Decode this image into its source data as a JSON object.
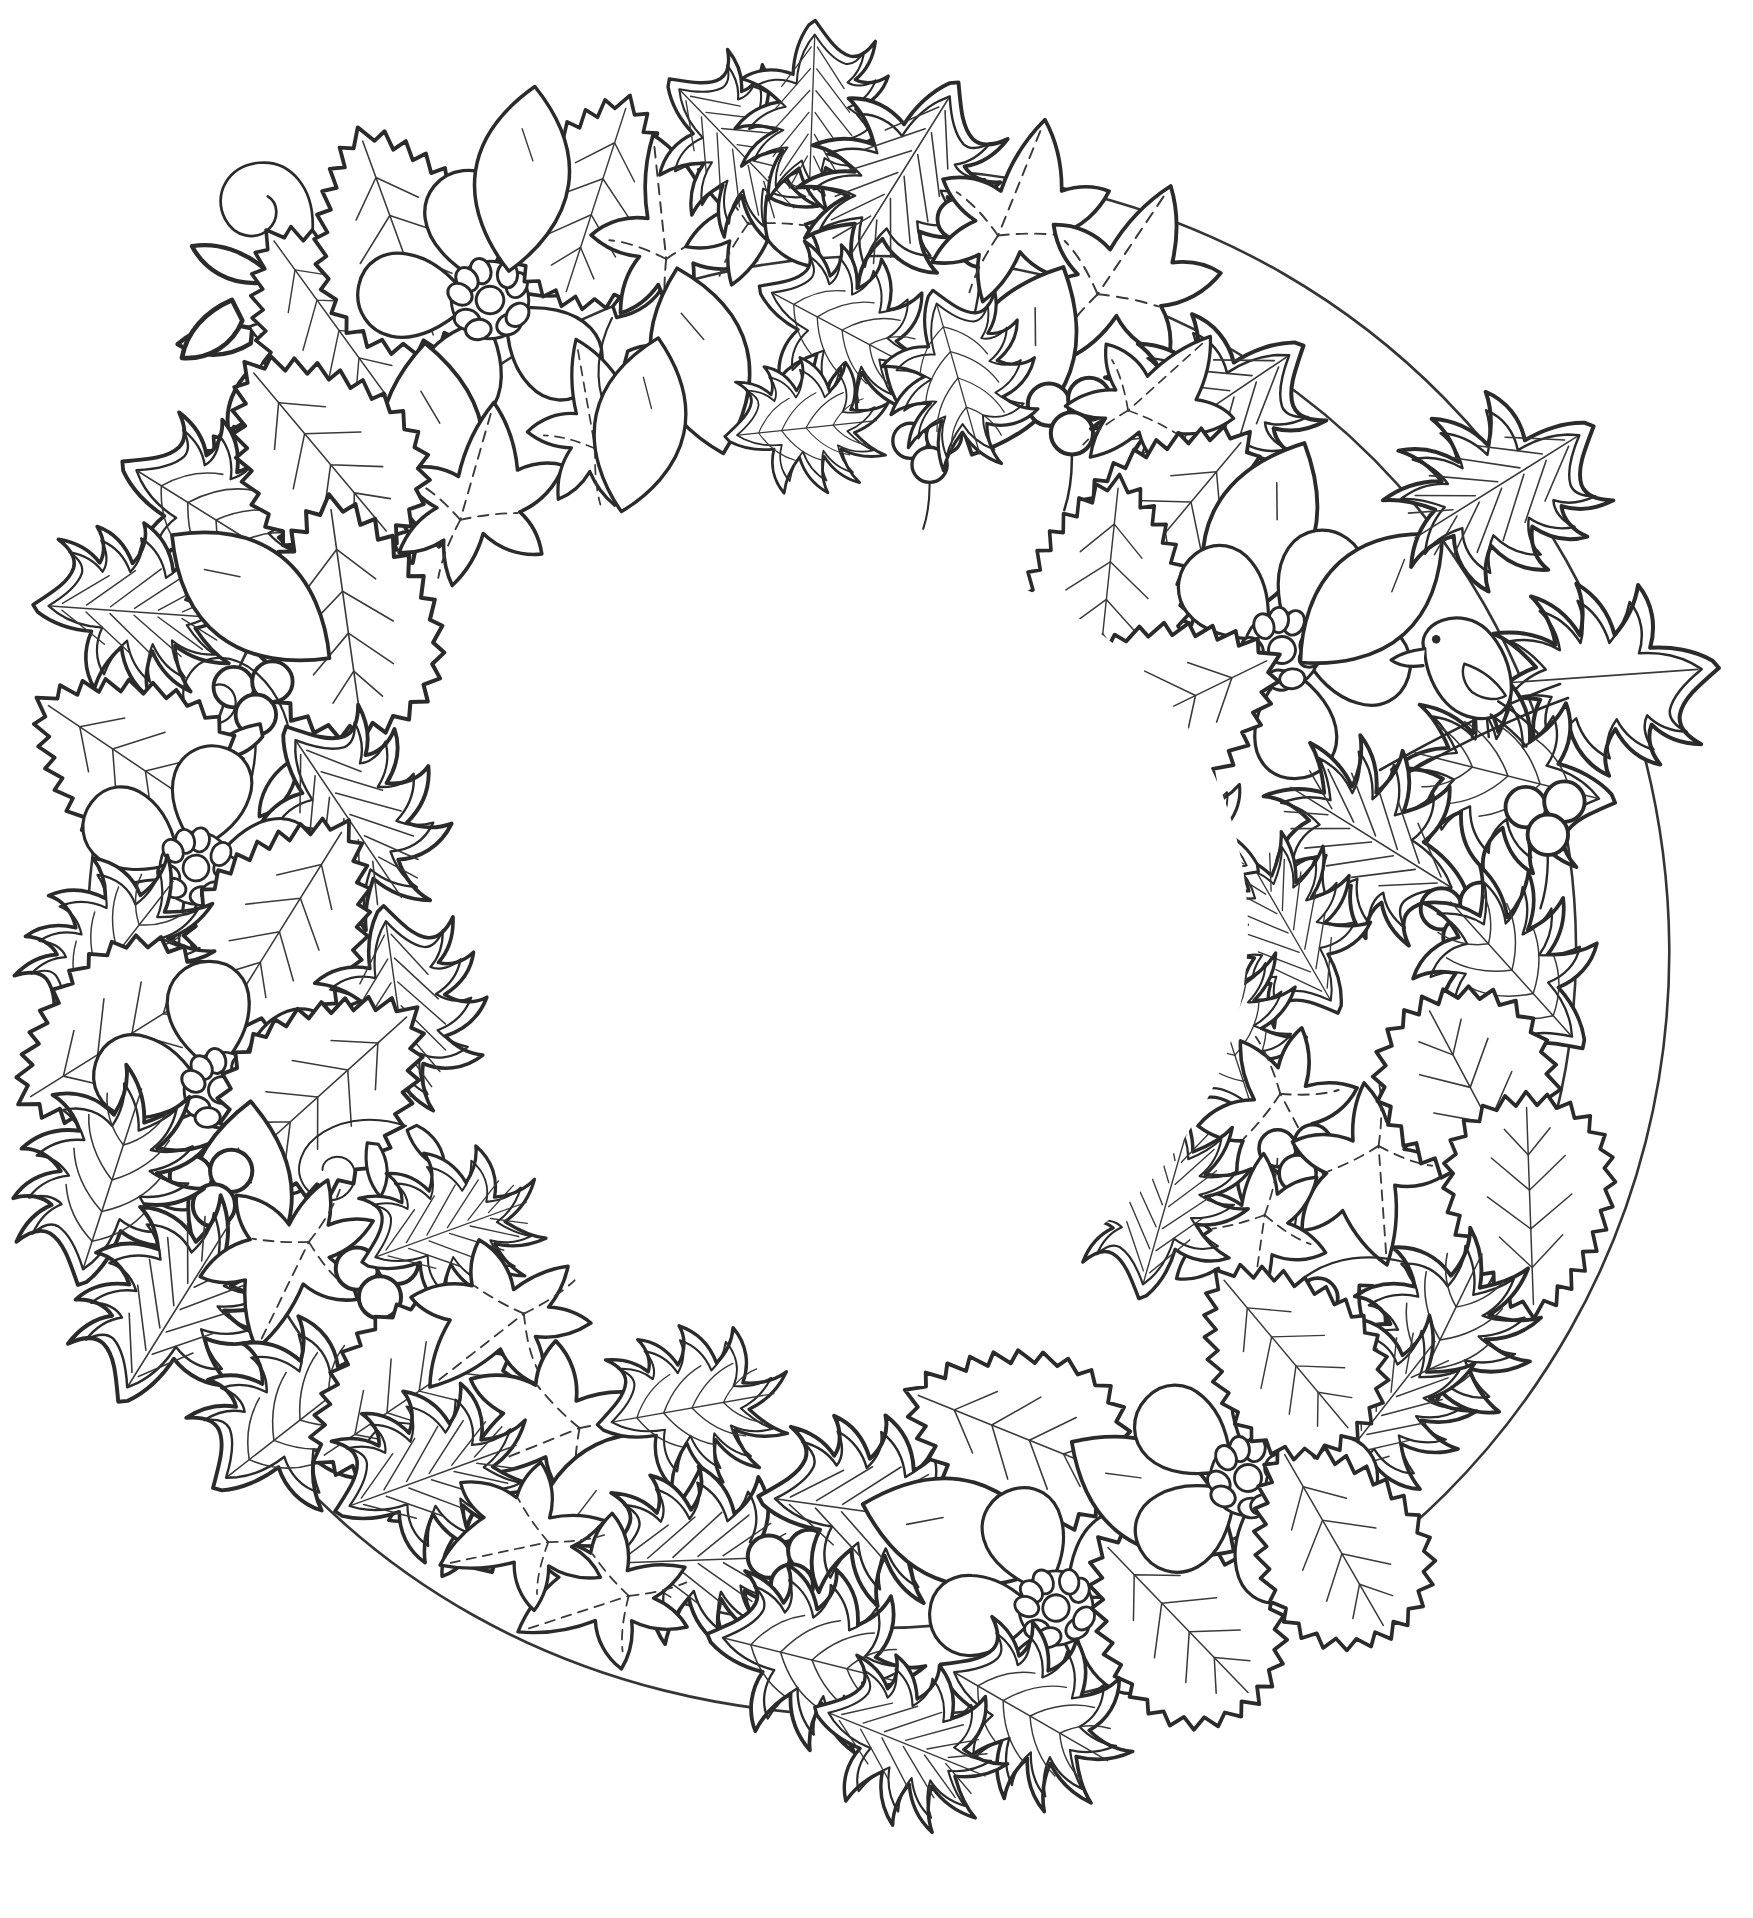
{
  "page": {
    "title": "Christmas Wreath Coloring Page",
    "kind": "line-art-coloring-illustration",
    "background_color": "#ffffff",
    "line_color": "#2b2b2b",
    "secondary_line_color": "#3a3a3a",
    "width": 1753,
    "height": 1918,
    "fill_color": "#ffffff"
  },
  "wreath": {
    "center_x": 876,
    "center_y": 930,
    "outer_radius": 840,
    "inner_radius": 400,
    "empty_center": true,
    "center_fill": "#ffffff"
  },
  "motifs": [
    {
      "name": "holly-leaf",
      "count": 34,
      "traits": "spiky lobed leaf with double outline and striped or web-like veins"
    },
    {
      "name": "ivy-leaf",
      "count": 22,
      "traits": "three to five lobed leaf with dashed centre veins"
    },
    {
      "name": "serrated-leaf",
      "count": 18,
      "traits": "jagged saw-tooth edged leaf with fine hair veins"
    },
    {
      "name": "hellebore-flower",
      "count": 6,
      "traits": "five broad petals around a ring of small rounded stamens"
    },
    {
      "name": "berry-cluster",
      "count": 11,
      "traits": "group of three circular berries on a short stem"
    },
    {
      "name": "tendril-spiral",
      "count": 9,
      "traits": "curling vine spiral with tiny leaflets"
    },
    {
      "name": "bird",
      "count": 1,
      "traits": "small perching bird facing left, standing on a twig"
    }
  ],
  "flowers": [
    {
      "id": "flower-top-left",
      "cx": 490,
      "cy": 300,
      "r": 150,
      "rot": -18,
      "petals": 5,
      "stamens": 9
    },
    {
      "id": "flower-right-upper",
      "cx": 1282,
      "cy": 650,
      "r": 140,
      "rot": 24,
      "petals": 5,
      "stamens": 9
    },
    {
      "id": "flower-left-mid",
      "cx": 196,
      "cy": 868,
      "r": 128,
      "rot": 8,
      "petals": 5,
      "stamens": 9
    },
    {
      "id": "flower-left-lower",
      "cx": 222,
      "cy": 1090,
      "r": 140,
      "rot": -12,
      "petals": 5,
      "stamens": 9
    },
    {
      "id": "flower-bottom-right",
      "cx": 1248,
      "cy": 1478,
      "r": 138,
      "rot": 14,
      "petals": 5,
      "stamens": 9
    },
    {
      "id": "flower-bottom-mid",
      "cx": 1056,
      "cy": 1608,
      "r": 130,
      "rot": -26,
      "petals": 5,
      "stamens": 9
    }
  ],
  "berry_clusters": [
    {
      "id": "berries-top",
      "cx": 978,
      "cy": 232,
      "r": 17
    },
    {
      "id": "berries-top-right",
      "cx": 1070,
      "cy": 418,
      "r": 19
    },
    {
      "id": "berries-top-center",
      "cx": 928,
      "cy": 452,
      "r": 16
    },
    {
      "id": "berries-left-upper",
      "cx": 254,
      "cy": 700,
      "r": 18
    },
    {
      "id": "berries-left-low",
      "cx": 212,
      "cy": 1190,
      "r": 19
    },
    {
      "id": "berries-right-upper",
      "cx": 1546,
      "cy": 820,
      "r": 18
    },
    {
      "id": "berries-right-mid",
      "cx": 1462,
      "cy": 922,
      "r": 18
    },
    {
      "id": "berries-right-low",
      "cx": 1300,
      "cy": 1316,
      "r": 18
    },
    {
      "id": "berries-bottom-left",
      "cx": 378,
      "cy": 1282,
      "r": 19
    },
    {
      "id": "berries-bottom-mid",
      "cx": 790,
      "cy": 1570,
      "r": 19
    },
    {
      "id": "berries-bottom-right",
      "cx": 1296,
      "cy": 1160,
      "r": 17
    }
  ],
  "bird": {
    "id": "perched-bird",
    "x": 1458,
    "y": 690,
    "facing": "left",
    "perched_on": "twig"
  },
  "center_note": {
    "visible": false,
    "text": ""
  }
}
